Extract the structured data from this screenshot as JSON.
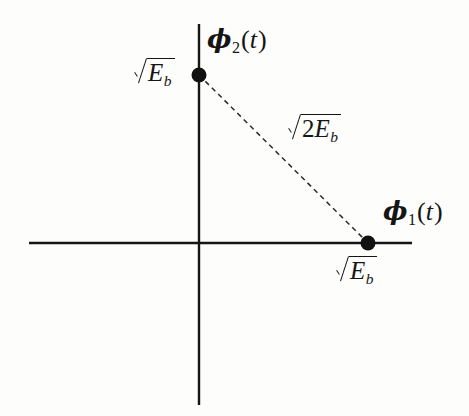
{
  "figure": {
    "background_color": "#fdfdfc",
    "line_color": "#151515"
  },
  "axes": {
    "horizontal": {
      "name": "phi1-axis",
      "label": "φ₁(t)",
      "label_parts": {
        "symbol": "ϕ",
        "subscript": "1",
        "argument": "(t)"
      },
      "x_start": 29,
      "x_end": 412,
      "y": 243
    },
    "vertical": {
      "name": "phi2-axis",
      "label": "φ₂(t)",
      "label_parts": {
        "symbol": "ϕ",
        "subscript": "2",
        "argument": "(t)"
      },
      "x": 199,
      "y_start": 24,
      "y_end": 405
    },
    "origin": {
      "x": 199,
      "y": 243
    }
  },
  "points": [
    {
      "name": "signal-point-s2",
      "x": 199,
      "y": 75,
      "radius": 7,
      "label": "√E_b",
      "label_position": "left"
    },
    {
      "name": "signal-point-s1",
      "x": 368,
      "y": 243,
      "radius": 7,
      "label": "√E_b",
      "label_position": "below"
    }
  ],
  "connector": {
    "name": "distance-line",
    "style": "dashed",
    "from": {
      "x": 199,
      "y": 75
    },
    "to": {
      "x": 368,
      "y": 243
    },
    "label": "√(2E_b)"
  },
  "labels": {
    "sqrt_eb_left": {
      "radicand_coefficient": "",
      "radicand_symbol": "E",
      "radicand_subscript": "b"
    },
    "sqrt_eb_bottom": {
      "radicand_coefficient": "",
      "radicand_symbol": "E",
      "radicand_subscript": "b"
    },
    "sqrt_2eb": {
      "radicand_coefficient": "2",
      "radicand_symbol": "E",
      "radicand_subscript": "b"
    },
    "phi1": {
      "symbol": "ϕ",
      "subscript": "1",
      "open": "(",
      "arg": "t",
      "close": ")"
    },
    "phi2": {
      "symbol": "ϕ",
      "subscript": "2",
      "open": "(",
      "arg": "t",
      "close": ")"
    }
  }
}
